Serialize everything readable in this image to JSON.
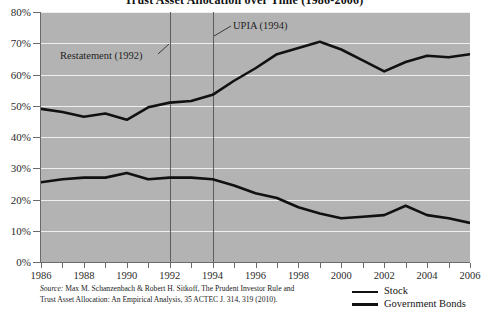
{
  "chart_data": {
    "type": "line",
    "title": "Trust Asset Allocation over Time (1986-2006)",
    "xlabel": "",
    "ylabel": "",
    "xlim": [
      1986,
      2006
    ],
    "ylim": [
      0,
      80
    ],
    "grid": true,
    "legend_position": "bottom-right",
    "x": [
      1986,
      1987,
      1988,
      1989,
      1990,
      1991,
      1992,
      1993,
      1994,
      1995,
      1996,
      1997,
      1998,
      1999,
      2000,
      2001,
      2002,
      2003,
      2004,
      2005,
      2006
    ],
    "x_tick_labels": [
      "1986",
      "1988",
      "1990",
      "1992",
      "1994",
      "1996",
      "1998",
      "2000",
      "2002",
      "2004",
      "2006"
    ],
    "y_tick_labels": [
      "0%",
      "10%",
      "20%",
      "30%",
      "40%",
      "50%",
      "60%",
      "70%",
      "80%"
    ],
    "y_ticks": [
      0,
      10,
      20,
      30,
      40,
      50,
      60,
      70,
      80
    ],
    "series": [
      {
        "name": "Stock",
        "color": "#111111",
        "values": [
          49.0,
          48.0,
          46.5,
          47.5,
          45.5,
          49.5,
          51.0,
          51.5,
          53.5,
          58.0,
          62.0,
          66.5,
          68.5,
          70.5,
          68.0,
          64.5,
          61.0,
          64.0,
          66.0,
          65.5,
          66.5
        ]
      },
      {
        "name": "Government Bonds",
        "color": "#111111",
        "values": [
          25.5,
          26.5,
          27.0,
          27.0,
          28.5,
          26.5,
          27.0,
          27.0,
          26.5,
          24.5,
          22.0,
          20.5,
          17.5,
          15.5,
          14.0,
          14.5,
          15.0,
          18.0,
          15.0,
          14.0,
          12.5
        ]
      }
    ],
    "annotations": [
      {
        "label": "Restatement (1992)",
        "year": 1992
      },
      {
        "label": "UPIA (1994)",
        "year": 1994
      }
    ]
  },
  "legend": {
    "items": [
      {
        "label": "Stock"
      },
      {
        "label": "Government Bonds"
      }
    ]
  },
  "source": {
    "lead": "Source:",
    "line1": " Max M. Schanzenbach & Robert H. Sitkoff, The Prudent Investor Rule and",
    "line2": "Trust Asset Allocation: An Empirical Analysis, 35 ACTEC J. 314, 319 (2010)."
  },
  "colors": {
    "plot_background": "#b3b3b3",
    "gridline": "#efefef",
    "rule": "#5d5d5d",
    "axis": "#6a6a6a",
    "series": "#111111"
  }
}
